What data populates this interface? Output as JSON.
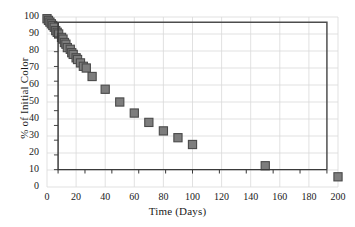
{
  "chart_data": {
    "type": "scatter",
    "title": "",
    "xlabel": "Time (Days)",
    "ylabel": "% of Initial Color",
    "xlim": [
      0,
      200
    ],
    "ylim": [
      0,
      100
    ],
    "xticks": [
      0,
      20,
      40,
      60,
      80,
      100,
      120,
      140,
      160,
      180,
      200
    ],
    "yticks": [
      0,
      10,
      20,
      30,
      40,
      50,
      60,
      70,
      80,
      90,
      100
    ],
    "grid": true,
    "legend": "none",
    "marker": "square",
    "marker_color": "#7d7d7d",
    "marker_edge_color": "#4a4a4a",
    "series": [
      {
        "name": "% of Initial Color",
        "points": [
          {
            "x": 0,
            "y": 99
          },
          {
            "x": 1,
            "y": 98
          },
          {
            "x": 2,
            "y": 97
          },
          {
            "x": 3,
            "y": 96
          },
          {
            "x": 4,
            "y": 95
          },
          {
            "x": 5,
            "y": 94
          },
          {
            "x": 6,
            "y": 92
          },
          {
            "x": 7,
            "y": 91
          },
          {
            "x": 8,
            "y": 90
          },
          {
            "x": 10,
            "y": 88
          },
          {
            "x": 11,
            "y": 87
          },
          {
            "x": 12,
            "y": 85
          },
          {
            "x": 13,
            "y": 84
          },
          {
            "x": 14,
            "y": 82
          },
          {
            "x": 16,
            "y": 81
          },
          {
            "x": 17,
            "y": 79
          },
          {
            "x": 18,
            "y": 78
          },
          {
            "x": 20,
            "y": 76
          },
          {
            "x": 21,
            "y": 75
          },
          {
            "x": 23,
            "y": 73
          },
          {
            "x": 25,
            "y": 71
          },
          {
            "x": 27,
            "y": 70
          },
          {
            "x": 31,
            "y": 65
          },
          {
            "x": 40,
            "y": 57.5
          },
          {
            "x": 50,
            "y": 50
          },
          {
            "x": 60,
            "y": 43.5
          },
          {
            "x": 70,
            "y": 38
          },
          {
            "x": 80,
            "y": 33
          },
          {
            "x": 90,
            "y": 29
          },
          {
            "x": 100,
            "y": 25
          },
          {
            "x": 150,
            "y": 12.5
          },
          {
            "x": 200,
            "y": 6
          }
        ]
      }
    ]
  },
  "colors": {
    "grid": "#d9d9d9",
    "axis": "#3a3a3a",
    "frame": "#4d4d4d",
    "marker_fill": "#7d7d7d",
    "marker_edge": "#4a4a4a",
    "text": "#1a1a1a",
    "background": "#ffffff"
  }
}
